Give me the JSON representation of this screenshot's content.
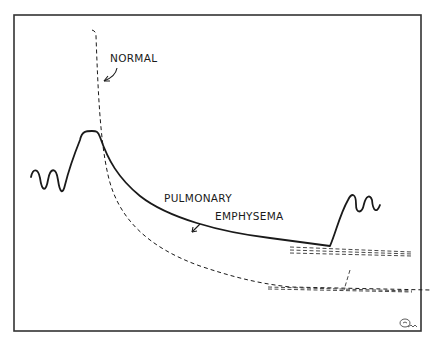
{
  "diagram": {
    "type": "expiratory-flow-curve-comparison",
    "labels": {
      "normal": "NORMAL",
      "emphysema_line1": "PULMONARY",
      "emphysema_line2": "EMPHYSEMA"
    },
    "curves": [
      {
        "name": "normal",
        "style": "dashed",
        "description": "Steep rapid decay then long flat tail"
      },
      {
        "name": "pulmonary-emphysema",
        "style": "solid",
        "description": "Plateau peak, slower decay, then sharp rise to oscillation"
      }
    ],
    "signature_mark": "artist initials (illegible)",
    "colors": {
      "ink": "#1a1a1a",
      "frame": "#333333",
      "background": "#ffffff"
    }
  }
}
